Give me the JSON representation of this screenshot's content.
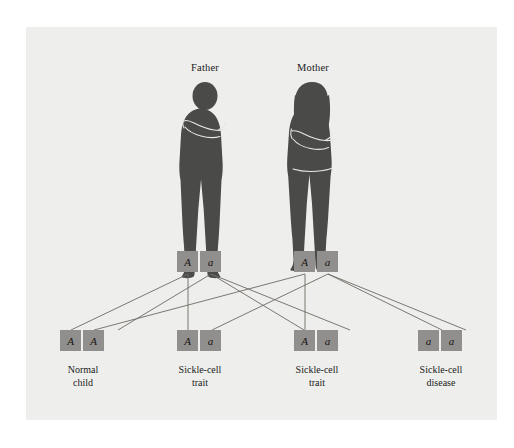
{
  "figure": {
    "background_color": "#eeeeec",
    "page_color": "#ffffff"
  },
  "parents": [
    {
      "id": "father",
      "label": "Father",
      "silhouette": "adult-male-arms-crossed",
      "genotype": [
        "A",
        "a"
      ],
      "silhouette_color": "#4a4a48"
    },
    {
      "id": "mother",
      "label": "Mother",
      "silhouette": "adult-female-arms-crossed",
      "genotype": [
        "A",
        "a"
      ],
      "silhouette_color": "#4a4a48"
    }
  ],
  "children": [
    {
      "id": "child-1",
      "genotype": [
        "A",
        "A"
      ],
      "label_line1": "Normal",
      "label_line2": "child"
    },
    {
      "id": "child-2",
      "genotype": [
        "A",
        "a"
      ],
      "label_line1": "Sickle-cell",
      "label_line2": "trait"
    },
    {
      "id": "child-3",
      "genotype": [
        "A",
        "a"
      ],
      "label_line1": "Sickle-cell",
      "label_line2": "trait"
    },
    {
      "id": "child-4",
      "genotype": [
        "a",
        "a"
      ],
      "label_line1": "Sickle-cell",
      "label_line2": "disease"
    }
  ],
  "colors": {
    "allele_box": "#918f8d",
    "allele_text": "#17130f",
    "line": "#6e6a63",
    "label_text": "#1a1a1a"
  }
}
